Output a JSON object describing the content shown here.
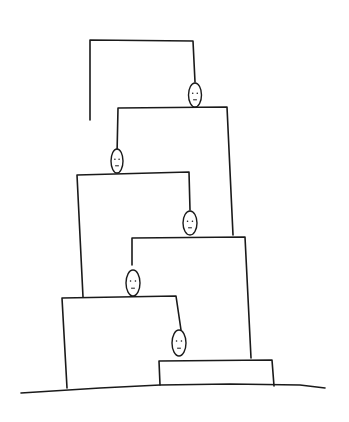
{
  "artwork": {
    "description": "Hand-drawn line sketch of a stack of stepped rectangular blocks with small egg-shaped figures with faces, each suspended by a string from the block above, resting on a ground line",
    "ink_color": "#1a1a1a",
    "background_color": "#ffffff"
  },
  "blocks": [
    {
      "id": 1,
      "points": [
        [
          90,
          120
        ],
        [
          90,
          40
        ],
        [
          193,
          41
        ],
        [
          195,
          82
        ]
      ]
    },
    {
      "id": 2,
      "points": [
        [
          117,
          155
        ],
        [
          118,
          108
        ],
        [
          227,
          107
        ],
        [
          233,
          235
        ]
      ]
    },
    {
      "id": 3,
      "points": [
        [
          83,
          297
        ],
        [
          77,
          175
        ],
        [
          189,
          172
        ],
        [
          190,
          210
        ]
      ]
    },
    {
      "id": 4,
      "points": [
        [
          132,
          265
        ],
        [
          132,
          238
        ],
        [
          245,
          237
        ],
        [
          251,
          358
        ]
      ]
    },
    {
      "id": 5,
      "points": [
        [
          67,
          388
        ],
        [
          62,
          298
        ],
        [
          176,
          296
        ],
        [
          181,
          330
        ]
      ]
    },
    {
      "id": 6,
      "points": [
        [
          160,
          385
        ],
        [
          159,
          361
        ],
        [
          272,
          360
        ],
        [
          274,
          386
        ]
      ]
    }
  ],
  "ground": {
    "points": [
      [
        21,
        393
      ],
      [
        100,
        388
      ],
      [
        160,
        385
      ],
      [
        230,
        384
      ],
      [
        300,
        385
      ],
      [
        325,
        388
      ]
    ]
  },
  "figures": [
    {
      "id": 1,
      "cx": 195,
      "cy": 95,
      "rx": 6.5,
      "ry": 12
    },
    {
      "id": 2,
      "cx": 117,
      "cy": 161,
      "rx": 6,
      "ry": 12
    },
    {
      "id": 3,
      "cx": 190,
      "cy": 223,
      "rx": 7,
      "ry": 12
    },
    {
      "id": 4,
      "cx": 133,
      "cy": 283,
      "rx": 7,
      "ry": 13
    },
    {
      "id": 5,
      "cx": 179,
      "cy": 343,
      "rx": 7,
      "ry": 13
    }
  ]
}
